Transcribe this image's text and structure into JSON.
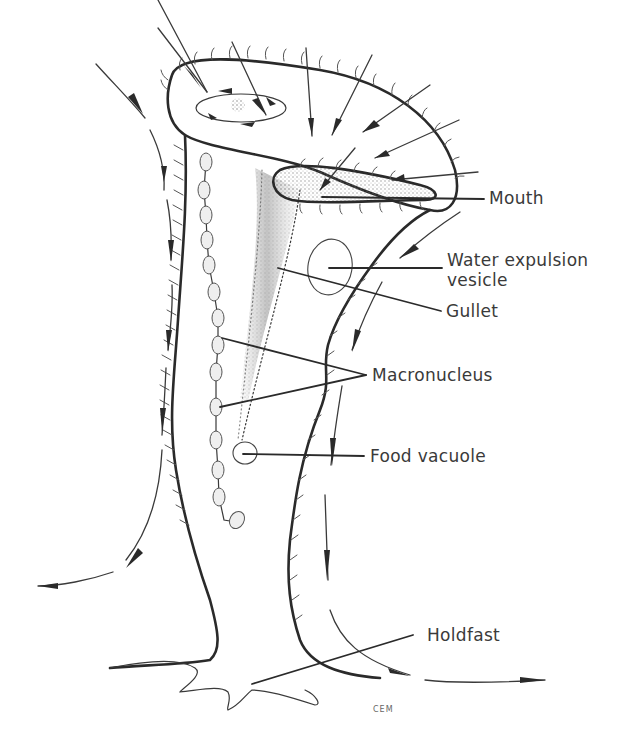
{
  "figure": {
    "labels": {
      "mouth": "Mouth",
      "water_expulsion_vesicle_line1": "Water expulsion",
      "water_expulsion_vesicle_line2": "vesicle",
      "gullet": "Gullet",
      "macronucleus": "Macronucleus",
      "food_vacuole": "Food vacuole",
      "holdfast": "Holdfast"
    },
    "signature": "CEM",
    "colors": {
      "background": "#ffffff",
      "ink": "#2a2a2a",
      "label_text": "#3a3a3a"
    }
  }
}
